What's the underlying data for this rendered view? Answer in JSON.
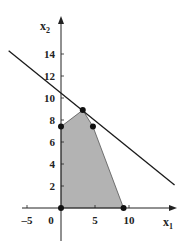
{
  "chart_data": {
    "type": "area",
    "title": "",
    "xlabel": "x1",
    "ylabel": "x2",
    "x_ticks": [
      -5,
      0,
      5,
      10
    ],
    "x_tick_labels": [
      "-5",
      "0",
      "5",
      "10"
    ],
    "y_ticks": [
      2,
      4,
      6,
      8,
      10,
      12,
      14
    ],
    "y_tick_labels": [
      "2",
      "4",
      "6",
      "8",
      "10",
      "12",
      "14"
    ],
    "xlim": [
      -6,
      17
    ],
    "ylim": [
      -3,
      18
    ],
    "grid": false,
    "legend": null,
    "feasible_region": {
      "description": "Shaded polygon (feasible region)",
      "fill_color": "#b3b3b3",
      "vertices": [
        [
          0,
          0
        ],
        [
          0,
          7.4
        ],
        [
          3.2,
          8.9
        ],
        [
          4.7,
          7.4
        ],
        [
          9.2,
          0
        ]
      ]
    },
    "marked_points": [
      [
        0,
        0
      ],
      [
        0,
        7.4
      ],
      [
        3.2,
        8.9
      ],
      [
        4.7,
        7.4
      ],
      [
        9.2,
        0
      ]
    ],
    "objective_line": {
      "description": "Straight line tangent at optimal vertex",
      "from": [
        -7.7,
        14.3
      ],
      "to": [
        16.7,
        2.1
      ]
    }
  },
  "labels": {
    "x_axis_main": "x",
    "x_axis_sub": "1",
    "y_axis_main": "x",
    "y_axis_sub": "2"
  },
  "colors": {
    "axis": "#222222",
    "region": "#b3b3b3",
    "line": "#1a1a1a",
    "points": "#111111"
  }
}
